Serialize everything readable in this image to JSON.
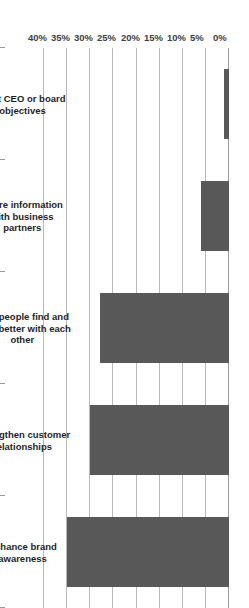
{
  "chart_data": {
    "type": "bar",
    "orientation": "horizontal",
    "title": "",
    "subtitle": "",
    "xlabel": "",
    "ylabel": "",
    "categories": [
      "Enhance brand awareness",
      "Strengthen customer relationships",
      "Help people find and work better with each other",
      "Share information with business partners",
      "Meet CEO or board objectives"
    ],
    "values": [
      35,
      30,
      28,
      6,
      1
    ],
    "value_format": "percent",
    "axis_ticks": [
      "40%",
      "35%",
      "30%",
      "25%",
      "20%",
      "15%",
      "10%",
      "5%",
      "0%"
    ],
    "axis_tick_values": [
      40,
      35,
      30,
      25,
      20,
      15,
      10,
      5,
      0
    ],
    "xlim": [
      0,
      40
    ],
    "ylim": [
      0,
      40
    ],
    "grid": true,
    "legend": false,
    "legend_position": "none",
    "series": [
      {
        "name": "Share of respondents",
        "values": [
          35,
          30,
          28,
          6,
          1
        ]
      }
    ],
    "colors": {
      "bar": "#585858",
      "gridline": "#b9b9b9",
      "axis": "#8c8c8c",
      "background": "#ffffff",
      "tick_label": "#404040",
      "category_label": "#1f1f1f"
    }
  }
}
